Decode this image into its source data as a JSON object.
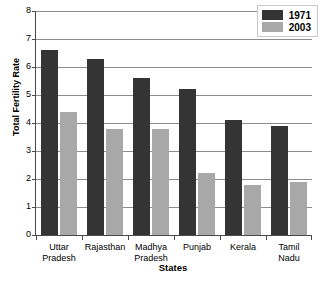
{
  "chart_data": {
    "type": "bar",
    "title": "",
    "xlabel": "States",
    "ylabel": "Total Fertility Rate",
    "categories": [
      "Uttar Pradesh",
      "Rajasthan",
      "Madhya Pradesh",
      "Punjab",
      "Kerala",
      "Tamil Nadu"
    ],
    "category_lines": [
      [
        "Uttar",
        "Pradesh"
      ],
      [
        "Rajasthan",
        ""
      ],
      [
        "Madhya",
        "Pradesh"
      ],
      [
        "Punjab",
        ""
      ],
      [
        "Kerala",
        ""
      ],
      [
        "Tamil",
        "Nadu"
      ]
    ],
    "series": [
      {
        "name": "1971",
        "color": "#343434",
        "values": [
          6.6,
          6.3,
          5.6,
          5.2,
          4.1,
          3.9
        ]
      },
      {
        "name": "2003",
        "color": "#a8a8a8",
        "values": [
          4.4,
          3.8,
          3.8,
          2.2,
          1.8,
          1.9
        ]
      }
    ],
    "ylim": [
      0,
      8
    ],
    "yticks": [
      0,
      1,
      2,
      3,
      4,
      5,
      6,
      7,
      8
    ],
    "ytick_labels": [
      "0",
      "1",
      "2",
      "3",
      "4",
      "5",
      "6",
      "7",
      "8"
    ],
    "grid": true,
    "legend_position": "top-right"
  },
  "legend": {
    "entries": [
      {
        "label": "1971",
        "color": "#343434"
      },
      {
        "label": "2003",
        "color": "#a8a8a8"
      }
    ]
  },
  "axes": {
    "x_title": "States",
    "y_title": "Total Fertility Rate"
  }
}
